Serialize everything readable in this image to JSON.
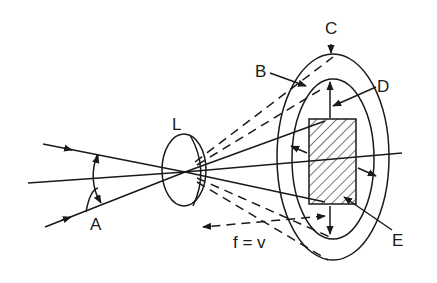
{
  "diagram": {
    "type": "optics-lens-image-formation",
    "labels": {
      "A": "A",
      "B": "B",
      "C": "C",
      "D": "D",
      "E": "E",
      "L": "L",
      "focal": "f = v"
    },
    "colors": {
      "ink": "#1a1a1a",
      "background": "#ffffff"
    }
  }
}
